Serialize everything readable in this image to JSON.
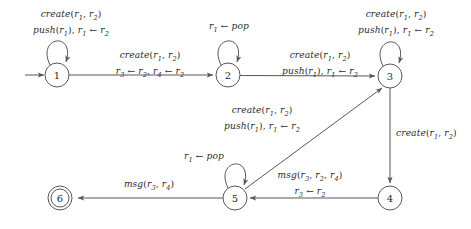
{
  "diagram": {
    "colors": {
      "stroke": "#575757",
      "text": "#2b2b2b",
      "background": "#ffffff"
    },
    "states": [
      {
        "id": "1",
        "label": "1",
        "cx": 57,
        "cy": 75,
        "r": 12,
        "accepting": false
      },
      {
        "id": "2",
        "label": "2",
        "cx": 228,
        "cy": 75,
        "r": 12,
        "accepting": false
      },
      {
        "id": "3",
        "label": "3",
        "cx": 390,
        "cy": 76,
        "r": 12,
        "accepting": false
      },
      {
        "id": "4",
        "label": "4",
        "cx": 390,
        "cy": 198,
        "r": 12,
        "accepting": false
      },
      {
        "id": "5",
        "label": "5",
        "cx": 235,
        "cy": 198,
        "r": 12,
        "accepting": false
      },
      {
        "id": "6",
        "label": "6",
        "cx": 60,
        "cy": 198,
        "r": 12,
        "accepting": true
      }
    ],
    "start_state": "1",
    "transitions": [
      {
        "id": "loop-1",
        "from": "1",
        "to": "1",
        "kind": "self-loop",
        "line1": "create(r1, r2)",
        "line2": "push(r1), r1 ← r2"
      },
      {
        "id": "edge-1-2",
        "from": "1",
        "to": "2",
        "kind": "edge",
        "line1": "create(r1, r2)",
        "line2": "r3 ← r2, r4 ← r2"
      },
      {
        "id": "loop-2",
        "from": "2",
        "to": "2",
        "kind": "self-loop",
        "line1": "r1 ← pop",
        "line2": ""
      },
      {
        "id": "edge-2-3",
        "from": "2",
        "to": "3",
        "kind": "edge",
        "line1": "create(r1, r2)",
        "line2": "push(r1), r1 ← r2"
      },
      {
        "id": "loop-3",
        "from": "3",
        "to": "3",
        "kind": "self-loop",
        "line1": "create(r1, r2)",
        "line2": "push(r1), r1 ← r2"
      },
      {
        "id": "edge-3-4",
        "from": "3",
        "to": "4",
        "kind": "edge",
        "line1": "create(r1, r2)",
        "line2": ""
      },
      {
        "id": "edge-4-5",
        "from": "4",
        "to": "5",
        "kind": "edge",
        "line1": "msg(r3, r2, r4)",
        "line2": "r3 ← r2"
      },
      {
        "id": "loop-5",
        "from": "5",
        "to": "5",
        "kind": "self-loop",
        "line1": "r1 ← pop",
        "line2": ""
      },
      {
        "id": "edge-5-3",
        "from": "5",
        "to": "3",
        "kind": "edge",
        "line1": "create(r1, r2)",
        "line2": "push(r1), r1 ← r2"
      },
      {
        "id": "edge-5-6",
        "from": "5",
        "to": "6",
        "kind": "edge",
        "line1": "msg(r3, r4)",
        "line2": ""
      }
    ]
  }
}
